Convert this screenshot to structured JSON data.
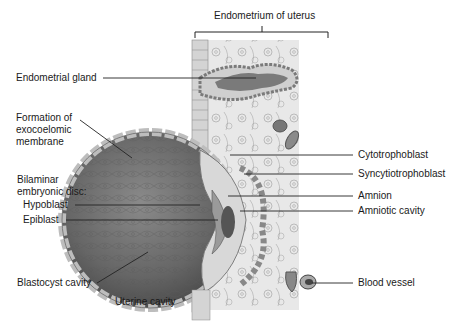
{
  "figure": {
    "header_label": "Endometrium of uterus",
    "labels_left": {
      "endometrial_gland": "Endometrial gland",
      "exocoelomic": [
        "Formation of",
        "exocoelomic",
        "membrane"
      ],
      "bilaminar": [
        "Bilaminar",
        "embryonic disc:"
      ],
      "hypoblast": "Hypoblast",
      "epiblast": "Epiblast",
      "blastocyst_cavity": "Blastocyst cavity",
      "uterine_cavity": "Uterine cavity"
    },
    "labels_right": {
      "cytotrophoblast": "Cytotrophoblast",
      "syncytiotrophoblast": "Syncytiotrophoblast",
      "amnion": "Amnion",
      "amniotic_cavity": "Amniotic cavity",
      "blood_vessel": "Blood vessel"
    },
    "colors": {
      "tissue_bg": "#e6e6e6",
      "blastocyst_dark": "#6e6e6e",
      "line": "#222222"
    }
  }
}
